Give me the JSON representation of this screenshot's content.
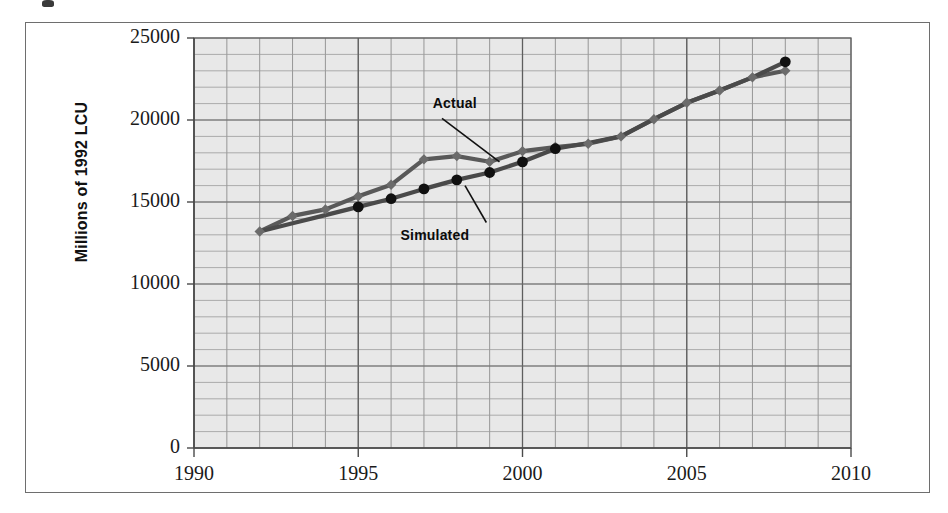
{
  "figure": {
    "y_axis_title": "Millions of 1992 LCU"
  },
  "chart_data": {
    "type": "line",
    "title": "",
    "subtitle": "",
    "xlabel": "",
    "ylabel": "Millions of 1992 LCU",
    "xlim": [
      1990,
      2010
    ],
    "ylim": [
      0,
      25000
    ],
    "xticks": [
      1990,
      1995,
      2000,
      2005,
      2010
    ],
    "xtick_labels": [
      "1990",
      "1995",
      "2000",
      "2005",
      "2010"
    ],
    "yticks": [
      0,
      5000,
      10000,
      15000,
      20000,
      25000
    ],
    "ytick_labels": [
      "0",
      "5000",
      "10000",
      "15000",
      "20000",
      "25000"
    ],
    "x_minor_step": 1,
    "y_minor_step": 1000,
    "grid": true,
    "plot_background": "#e8e8e8",
    "legend_position": "inline-annotation",
    "series": [
      {
        "name": "Actual",
        "color": "#595959",
        "marker": "diamond",
        "marker_color": "#6b6b6b",
        "x": [
          1992,
          1993,
          1994,
          1995,
          1996,
          1997,
          1998,
          1999,
          2000,
          2001,
          2002,
          2003,
          2004,
          2005,
          2006,
          2007,
          2008
        ],
        "values": [
          13200,
          14150,
          14550,
          15350,
          16050,
          17600,
          17800,
          17450,
          18100,
          18350,
          18550,
          19000,
          20050,
          21050,
          21800,
          22600,
          23000
        ]
      },
      {
        "name": "Simulated",
        "color": "#4a4a4a",
        "marker": "circle",
        "marker_color": "#111111",
        "x": [
          1992,
          1993,
          1994,
          1995,
          1996,
          1997,
          1998,
          1999,
          2000,
          2001,
          2002,
          2003,
          2004,
          2005,
          2006,
          2007,
          2008
        ],
        "values": [
          13200,
          13700,
          14200,
          14700,
          15200,
          15800,
          16350,
          16800,
          17450,
          18250,
          18600,
          19000,
          20050,
          21050,
          21800,
          22600,
          23550
        ]
      }
    ],
    "annotations": [
      {
        "text": "Actual",
        "x": 1998.0,
        "y": 21000
      },
      {
        "text": "Simulated",
        "x": 1997.2,
        "y": 12900
      }
    ]
  }
}
